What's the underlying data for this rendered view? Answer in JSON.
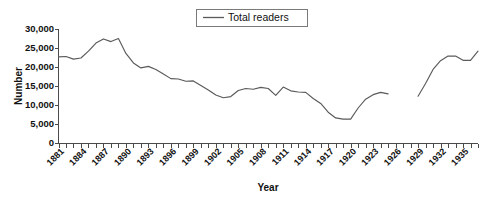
{
  "chart_data": {
    "type": "line",
    "title": "",
    "xlabel": "Year",
    "ylabel": "Number",
    "xlim": [
      1881,
      1937
    ],
    "ylim": [
      0,
      30000
    ],
    "grid": false,
    "legend_position": "top-center",
    "y_ticks": [
      0,
      5000,
      10000,
      15000,
      20000,
      25000,
      30000
    ],
    "y_tick_labels": [
      "0",
      "5,000",
      "10,000",
      "15,000",
      "20,000",
      "25,000",
      "30,000"
    ],
    "x_tick_labels": [
      "1881",
      "1884",
      "1887",
      "1890",
      "1893",
      "1896",
      "1899",
      "1902",
      "1905",
      "1908",
      "1911",
      "1914",
      "1917",
      "1920",
      "1923",
      "1926",
      "1929",
      "1932",
      "1935"
    ],
    "x_tick_label_step": 3,
    "x_tick_interval": 1,
    "series": [
      {
        "name": "Total readers",
        "color": "#5a5a5a",
        "has_gap": true,
        "gap_years": [
          1926,
          1927,
          1928
        ],
        "x": [
          1881,
          1882,
          1883,
          1884,
          1885,
          1886,
          1887,
          1888,
          1889,
          1890,
          1891,
          1892,
          1893,
          1894,
          1895,
          1896,
          1897,
          1898,
          1899,
          1900,
          1901,
          1902,
          1903,
          1904,
          1905,
          1906,
          1907,
          1908,
          1909,
          1910,
          1911,
          1912,
          1913,
          1914,
          1915,
          1916,
          1917,
          1918,
          1919,
          1920,
          1921,
          1922,
          1923,
          1924,
          1925,
          1929,
          1930,
          1931,
          1932,
          1933,
          1934,
          1935,
          1936,
          1937
        ],
        "values": [
          22700,
          22800,
          22100,
          22400,
          24200,
          26300,
          27400,
          26700,
          27500,
          23600,
          21100,
          19800,
          20200,
          19400,
          18200,
          17000,
          16900,
          16300,
          16400,
          15200,
          14000,
          12700,
          12000,
          12300,
          13900,
          14400,
          14200,
          14700,
          14400,
          12600,
          14800,
          13800,
          13500,
          13400,
          11800,
          10500,
          8200,
          6700,
          6400,
          6400,
          9300,
          11600,
          12800,
          13400,
          13000,
          12400,
          15700,
          19400,
          21700,
          22900,
          22900,
          21800,
          21800,
          24200
        ]
      }
    ]
  },
  "legend": {
    "entries": [
      {
        "label": "Total readers",
        "marker": "line-swatch"
      }
    ]
  }
}
